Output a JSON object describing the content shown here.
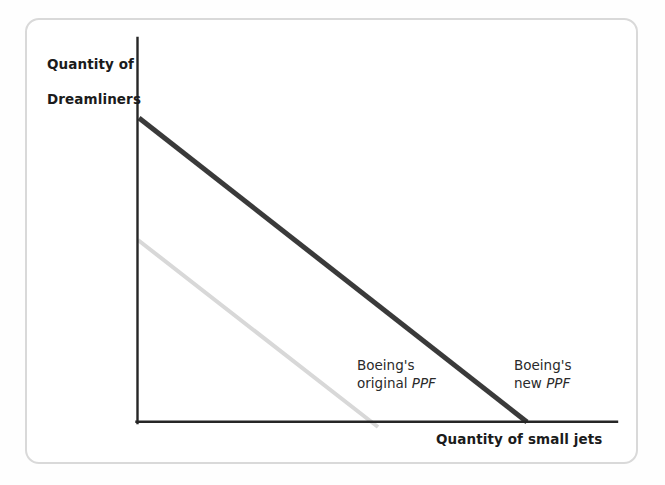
{
  "figure": {
    "kind": "production-possibility-frontier-diagram",
    "background_color": "#ffffff",
    "frame_color": "#d9d9d9"
  },
  "axes": {
    "y_title_line1": "Quantity of",
    "y_title_line2": "Dreamliners",
    "x_title": "Quantity of small jets",
    "axis_color": "#262626",
    "origin": {
      "x": 137,
      "y": 422
    },
    "y_axis_top": 38,
    "x_axis_right": 617
  },
  "annotations": {
    "original": {
      "line1": "Boeing's",
      "line2_prefix": "original ",
      "line2_italic": "PPF"
    },
    "new": {
      "line1": "Boeing's",
      "line2_prefix": "new ",
      "line2_italic": "PPF"
    }
  },
  "chart_data": {
    "type": "line",
    "title": "",
    "xlabel": "Quantity of small jets",
    "ylabel": "Quantity of Dreamliners",
    "grid": false,
    "legend_position": "inline-annotations",
    "axis_ticks": false,
    "series": [
      {
        "name": "Boeing's original PPF",
        "color": "#d8d8d8",
        "width": 4,
        "points": [
          {
            "x": 0,
            "y": 45.5
          },
          {
            "x": 28.5,
            "y": 0
          }
        ],
        "pixel_points": [
          {
            "x": 138,
            "y": 240
          },
          {
            "x": 378,
            "y": 427
          }
        ],
        "label": "Boeing's original PPF"
      },
      {
        "name": "Boeing's new PPF",
        "color": "#3a3a3a",
        "width": 5,
        "points": [
          {
            "x": 0,
            "y": 74
          },
          {
            "x": 46.5,
            "y": 0
          }
        ],
        "pixel_points": [
          {
            "x": 139,
            "y": 118
          },
          {
            "x": 527,
            "y": 422
          }
        ],
        "label": "Boeing's new PPF"
      }
    ],
    "xlim": [
      0,
      57
    ],
    "ylim": [
      0,
      93
    ],
    "note": "Two downward-sloping straight-line production possibility frontiers; the new PPF lies outside the original PPF, representing economic growth for Boeing."
  }
}
